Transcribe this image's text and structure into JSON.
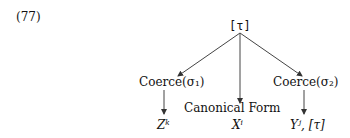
{
  "example_number": "(77)",
  "root": {
    "label": "[τ]"
  },
  "nodes": [
    {
      "label": "Coerce(σ₁)",
      "result": "Zᵏ"
    },
    {
      "label": "Canonical Form",
      "result": "Xⁱ"
    },
    {
      "label": "Coerce(σ₂)",
      "result": "Yʲ, [τ]"
    }
  ]
}
